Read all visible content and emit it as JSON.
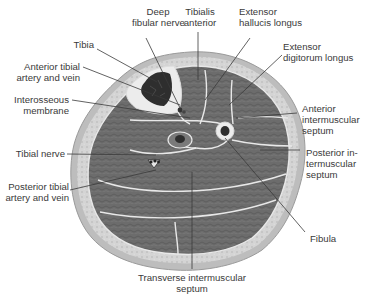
{
  "diagram": {
    "colors": {
      "skin_outer": "#b9b9b9",
      "subcutaneous": "#d6d6d6",
      "muscle": "#6f6f6f",
      "muscle_dark": "#575757",
      "fascia": "#e6e6e6",
      "bone": "#f0f0f0",
      "bone_marrow": "#2f2f2f",
      "leader_line": "#3a3a3a",
      "label_text": "#3a3a3a"
    },
    "labels": {
      "deep_fibular_nerve": [
        "Deep",
        "fibular nerve"
      ],
      "tibialis_anterior": [
        "Tibialis",
        "anterior"
      ],
      "extensor_hallucis_longus": [
        "Extensor",
        "hallucis longus"
      ],
      "extensor_digitorum_longus": [
        "Extensor",
        "digitorum longus"
      ],
      "tibia": [
        "Tibia"
      ],
      "anterior_tibial_artery_vein": [
        "Anterior tibial",
        "artery and vein"
      ],
      "interosseous_membrane": [
        "Interosseous",
        "membrane"
      ],
      "anterior_intermuscular_septum": [
        "Anterior",
        "intermuscular",
        "septum"
      ],
      "tibial_nerve": [
        "Tibial nerve"
      ],
      "posterior_intermuscular_septum": [
        "Posterior in-",
        "termuscular",
        "septum"
      ],
      "posterior_tibial_artery_vein": [
        "Posterior tibial",
        "artery and vein"
      ],
      "fibula": [
        "Fibula"
      ],
      "transverse_intermuscular_septum": [
        "Transverse intermuscular",
        "septum"
      ]
    }
  }
}
